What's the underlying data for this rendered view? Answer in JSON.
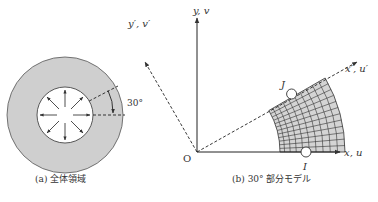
{
  "panel_a": {
    "caption": "(a)  全体領域",
    "angle_label": "30°",
    "colors": {
      "ring_fill": "#cfcfcf",
      "stroke": "#444444"
    }
  },
  "panel_b": {
    "caption": "(b)  30° 部分モデル",
    "axes": {
      "x": "x, u",
      "y": "y, v",
      "x_prime": "x′, u′",
      "y_prime": "y′, v′",
      "origin": "O"
    },
    "nodes": {
      "I": "I",
      "J": "J"
    },
    "mesh": {
      "radial_divisions": 10,
      "angular_divisions": 12,
      "angle_deg": 30
    },
    "colors": {
      "mesh_fill": "#d4d4d4",
      "stroke": "#333333"
    }
  }
}
